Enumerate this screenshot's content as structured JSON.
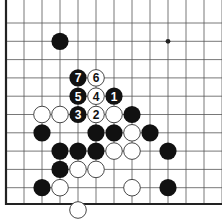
{
  "diagram": {
    "type": "go-board-fragment",
    "grid": {
      "origin_x": 6,
      "origin_y": 23,
      "spacing_x": 18,
      "spacing_y": 18.3,
      "columns": 12,
      "rows": 10,
      "left_edge": true,
      "bottom_edge": true
    },
    "colors": {
      "line": "#555555",
      "edge": "#222222",
      "black_stone": "#111111",
      "white_stone": "#ffffff",
      "white_outline": "#333333"
    },
    "hoshi": [
      {
        "col": 9,
        "row": 1
      }
    ],
    "stones": [
      {
        "col": 3,
        "row": 1,
        "color": "black",
        "label": ""
      },
      {
        "col": 4,
        "row": 3,
        "color": "black",
        "label": "7"
      },
      {
        "col": 5,
        "row": 3,
        "color": "white",
        "label": "6"
      },
      {
        "col": 4,
        "row": 4,
        "color": "black",
        "label": "5"
      },
      {
        "col": 5,
        "row": 4,
        "color": "white",
        "label": "4"
      },
      {
        "col": 6,
        "row": 4,
        "color": "black",
        "label": "1"
      },
      {
        "col": 2,
        "row": 5,
        "color": "white",
        "label": ""
      },
      {
        "col": 3,
        "row": 5,
        "color": "white",
        "label": ""
      },
      {
        "col": 4,
        "row": 5,
        "color": "black",
        "label": "3"
      },
      {
        "col": 5,
        "row": 5,
        "color": "white",
        "label": "2"
      },
      {
        "col": 6,
        "row": 5,
        "color": "white",
        "label": ""
      },
      {
        "col": 7,
        "row": 5,
        "color": "black",
        "label": ""
      },
      {
        "col": 2,
        "row": 6,
        "color": "black",
        "label": ""
      },
      {
        "col": 5,
        "row": 6,
        "color": "black",
        "label": ""
      },
      {
        "col": 6,
        "row": 6,
        "color": "black",
        "label": ""
      },
      {
        "col": 7,
        "row": 6,
        "color": "white",
        "label": ""
      },
      {
        "col": 8,
        "row": 6,
        "color": "black",
        "label": ""
      },
      {
        "col": 3,
        "row": 7,
        "color": "black",
        "label": ""
      },
      {
        "col": 4,
        "row": 7,
        "color": "black",
        "label": ""
      },
      {
        "col": 5,
        "row": 7,
        "color": "black",
        "label": ""
      },
      {
        "col": 6,
        "row": 7,
        "color": "white",
        "label": ""
      },
      {
        "col": 7,
        "row": 7,
        "color": "white",
        "label": ""
      },
      {
        "col": 9,
        "row": 7,
        "color": "black",
        "label": ""
      },
      {
        "col": 3,
        "row": 8,
        "color": "black",
        "label": ""
      },
      {
        "col": 4,
        "row": 8,
        "color": "white",
        "label": ""
      },
      {
        "col": 5,
        "row": 8,
        "color": "white",
        "label": ""
      },
      {
        "col": 2,
        "row": 9,
        "color": "black",
        "label": ""
      },
      {
        "col": 3,
        "row": 9,
        "color": "white",
        "label": ""
      },
      {
        "col": 7,
        "row": 9,
        "color": "white",
        "label": ""
      },
      {
        "col": 9,
        "row": 9,
        "color": "black",
        "label": ""
      },
      {
        "col": 4,
        "row": 10.3,
        "color": "white",
        "label": ""
      }
    ],
    "move_labels": [
      "1",
      "2",
      "3",
      "4",
      "5",
      "6",
      "7"
    ]
  }
}
